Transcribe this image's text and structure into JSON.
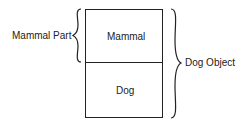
{
  "diagram": {
    "sections": [
      {
        "label": "Mammal"
      },
      {
        "label": "Dog"
      }
    ],
    "braces": {
      "left": {
        "label": "Mammal Part"
      },
      "right": {
        "label": "Dog Object"
      }
    }
  }
}
